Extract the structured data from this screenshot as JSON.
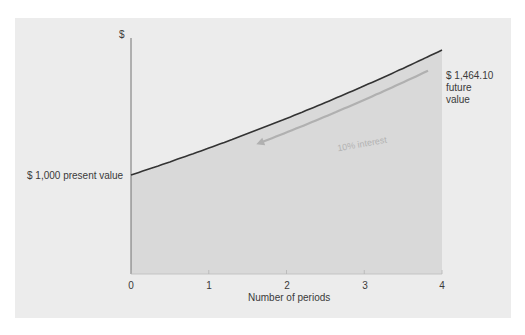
{
  "chart_data": {
    "type": "area",
    "title": "",
    "xlabel": "Number of periods",
    "ylabel": "$",
    "x": [
      0,
      1,
      2,
      3,
      4
    ],
    "series": [
      {
        "name": "Value at 10% interest",
        "values": [
          1000,
          1100,
          1210,
          1331,
          1464.1
        ]
      }
    ],
    "annotations": {
      "present_value": "$ 1,000 present value",
      "future_value_amount": "$ 1,464.10",
      "future_value_label": [
        "future",
        "value"
      ],
      "rate": "10% interest"
    },
    "xlim": [
      0,
      4
    ],
    "grid": false,
    "legend": "none",
    "colors": {
      "panel": "#ececec",
      "fill": "#d9d9d9",
      "curve": "#333333",
      "arrow": "#b0b0b0",
      "axis": "#555555"
    }
  },
  "axis": {
    "y_label": "$",
    "x_label": "Number of periods",
    "x_ticks": [
      "0",
      "1",
      "2",
      "3",
      "4"
    ]
  },
  "labels": {
    "present_value": "$ 1,000 present value",
    "future_amount": "$ 1,464.10",
    "future_line1": "future",
    "future_line2": "value",
    "rate": "10% interest"
  }
}
